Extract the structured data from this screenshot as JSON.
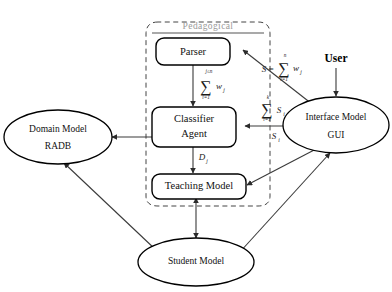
{
  "figure": {
    "background_color": "#ffffff",
    "stroke_color": "#000000",
    "group_label_color": "#9a9a9a"
  },
  "group": {
    "label": "Pedagogical",
    "style": "dashed-rounded"
  },
  "nodes": {
    "parser": {
      "label": "Parser",
      "shape": "rounded-rect"
    },
    "classifier_line1": {
      "label": "Classifier",
      "shape": "rounded-rect"
    },
    "classifier_line2": {
      "label": "Agent"
    },
    "teaching": {
      "label": "Teaching Model",
      "shape": "rounded-rect"
    },
    "domain_line1": {
      "label": "Domain Model",
      "shape": "ellipse"
    },
    "domain_line2": {
      "label": "RADB"
    },
    "interface_line1": {
      "label": "Interface Model",
      "shape": "ellipse"
    },
    "interface_line2": {
      "label": "GUI"
    },
    "student": {
      "label": "Student Model",
      "shape": "ellipse"
    },
    "user": {
      "label": "User",
      "shape": "text-actor"
    }
  },
  "edge_labels": {
    "parser_to_classifier": {
      "sigma": "∑",
      "upper": "j≤n",
      "lower": "i=1",
      "term": "w",
      "term_sub": "j"
    },
    "user_weight_sum": {
      "prefix": "S",
      "equals": "=",
      "sigma": "∑",
      "upper": "n",
      "lower": "i=1",
      "term": "w",
      "term_sub": "j"
    },
    "score_sum": {
      "sigma": "∑",
      "upper": "k",
      "lower": "i=1",
      "term": "S",
      "term_sub": "i"
    },
    "score_single": {
      "term": "S",
      "term_sub": "i"
    },
    "classifier_to_teaching": {
      "term": "D",
      "term_sub": "j"
    }
  },
  "edges": [
    {
      "from": "parser",
      "to": "classifier",
      "direction": "one-way"
    },
    {
      "from": "classifier",
      "to": "teaching",
      "direction": "one-way"
    },
    {
      "from": "domain",
      "to": "classifier",
      "direction": "two-way"
    },
    {
      "from": "interface",
      "to": "parser",
      "direction": "one-way"
    },
    {
      "from": "interface",
      "to": "classifier",
      "direction": "one-way"
    },
    {
      "from": "interface",
      "to": "teaching",
      "direction": "one-way"
    },
    {
      "from": "user",
      "to": "interface",
      "direction": "one-way"
    },
    {
      "from": "teaching",
      "to": "student",
      "direction": "two-way"
    },
    {
      "from": "domain",
      "to": "student",
      "direction": "two-way"
    },
    {
      "from": "student",
      "to": "interface",
      "direction": "two-way"
    }
  ]
}
